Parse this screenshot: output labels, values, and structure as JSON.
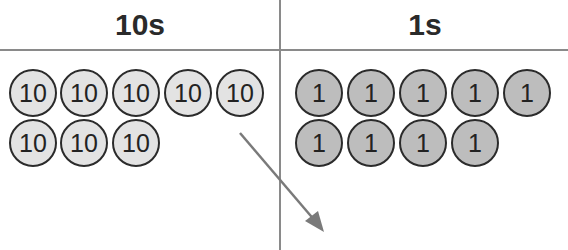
{
  "columns": [
    {
      "header": "10s",
      "coin_label": "10",
      "count": 8,
      "fill": "#e3e3e3"
    },
    {
      "header": "1s",
      "coin_label": "1",
      "count": 9,
      "fill": "#bdbdbd"
    }
  ],
  "tens": [
    "10",
    "10",
    "10",
    "10",
    "10",
    "10",
    "10",
    "10"
  ],
  "ones": [
    "1",
    "1",
    "1",
    "1",
    "1",
    "1",
    "1",
    "1",
    "1"
  ],
  "arrow": {
    "from": [
      240,
      133
    ],
    "to": [
      322,
      230
    ],
    "color": "#7a7a7a",
    "meaning": "regroup-ten-to-ones"
  }
}
